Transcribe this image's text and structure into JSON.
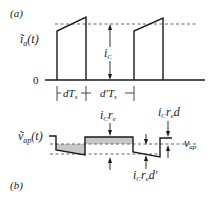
{
  "panel_a": {
    "label": "(a)",
    "ylabel": "ĩ",
    "ylabel_sub": "a",
    "ylabel_arg": "(t)",
    "zero_label": "0",
    "amplitude_label": "i",
    "amplitude_sub": "C",
    "interval1_label": "dT",
    "interval1_sub": "s",
    "interval2_label": "d′T",
    "interval2_sub": "s"
  },
  "panel_b": {
    "label": "(b)",
    "ylabel": "ṽ",
    "ylabel_sub": "ap",
    "ylabel_arg": "(t)",
    "step_label": "i",
    "step_sub1": "C",
    "step_mid": "r",
    "step_sub2": "e",
    "upper_label_tail": "d",
    "lower_label_tail": "d′",
    "avg_label": "v",
    "avg_sub": "ap"
  },
  "colors": {
    "line": "#1a1a1a",
    "fill": "#c8c8c8"
  }
}
